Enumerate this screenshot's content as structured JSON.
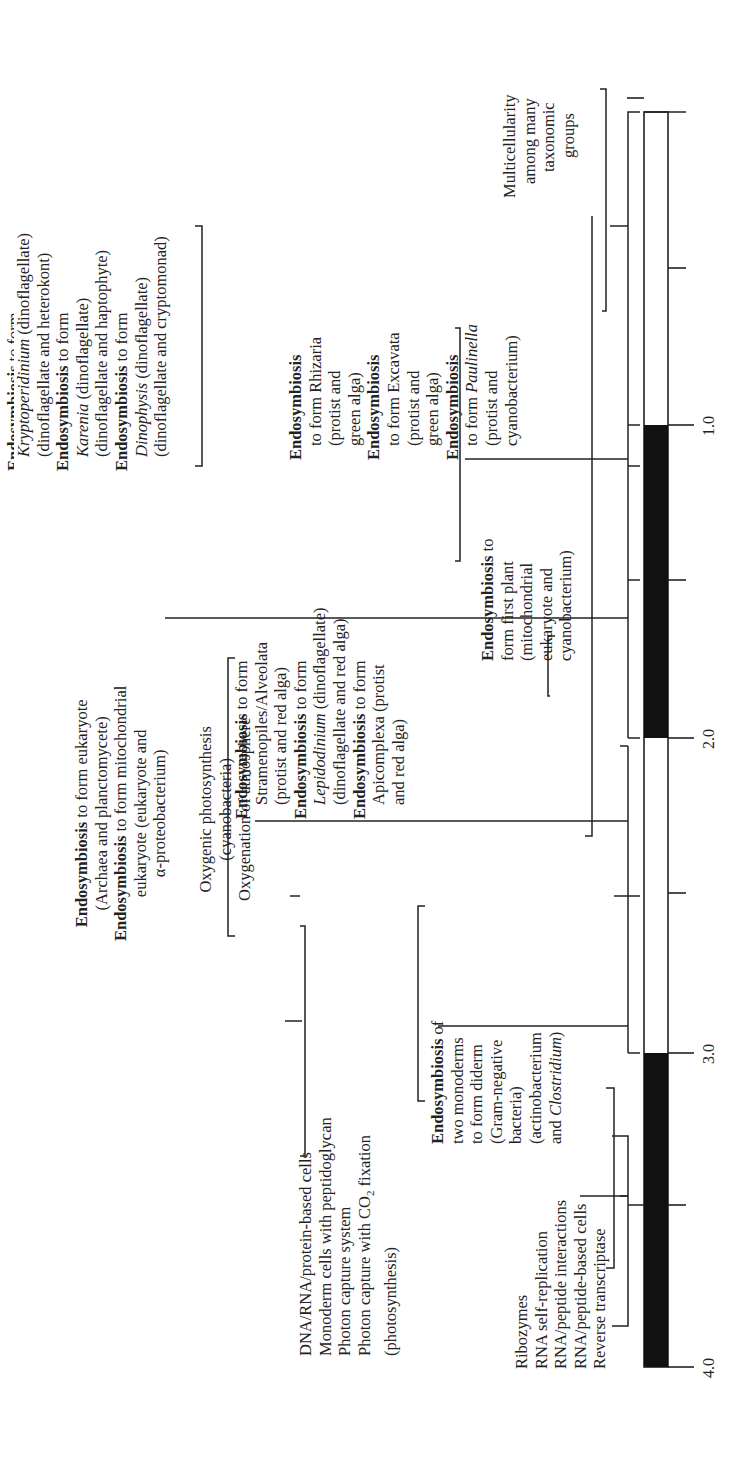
{
  "timeline": {
    "unit_note": "billions of years ago",
    "ticks": [
      "4.0",
      "3.0",
      "2.0",
      "1.0"
    ],
    "dark_segments": [
      [
        "4.0",
        "3.0"
      ],
      [
        "2.0",
        "1.0"
      ]
    ]
  },
  "events": {
    "ribozymes": {
      "lines": [
        "Ribozymes",
        "RNA self-replication",
        "RNA/peptide interactions",
        "RNA/peptide-based cells",
        "Reverse transcriptase"
      ]
    },
    "dna_cells": {
      "lines": [
        "DNA/RNA/protein-based cells",
        "Monoderm cells with peptidoglycan",
        "Photon capture system",
        "Photon capture with CO",
        "(photosynthesis)"
      ],
      "co2_sub": "2",
      "co2_tail": " fixation"
    },
    "diderm": {
      "bold": "Endosymbiosis",
      "lines": [
        " of",
        "two monoderms",
        "to form diderm",
        "(Gram-negative",
        "bacteria)",
        "(actinobacterium",
        "and "
      ],
      "italic": "Clostridium",
      "close": ")"
    },
    "oxygenic": {
      "lines": [
        "Oxygenic photosynthesis",
        "(cyanobacteria)",
        "Oxygenation of atmosphere"
      ]
    },
    "eukaryote": {
      "bold": "Endosymbiosis",
      "line1": " to form eukaryote",
      "line2": "(Archaea and planctomycete)",
      "line3": " to form mitochondrial",
      "line4": "eukaryote (eukaryote and",
      "line5": "α-proteobacterium)"
    },
    "first_plant": {
      "bold": "Endosymbiosis",
      "line1": " to",
      "lines": [
        "form first plant",
        "(mitochondrial",
        "eukaryote and",
        "cyanobacterium)"
      ]
    },
    "stramenopiles": {
      "bold": "Endosymbiosis",
      "to_form": " to form",
      "l1": "Stramenopiles/Alveolata",
      "l2": "(protist and red alga)",
      "l3_italic": "Lepidodinium",
      "l3_tail": " (dinoflagellate)",
      "l4": "(dinoflagellate and red alga)",
      "l5": "Apicomplexa (protist",
      "l6": "and red alga)"
    },
    "dinoflagellates": {
      "bold": "Endosymbiosis",
      "to_form": " to form",
      "k_italic": "Kryptoperidinium",
      "k_tail": " (dinoflagellate)",
      "k2": "(dinoflagellate and heterokont)",
      "ka_italic": "Karenia",
      "ka_tail": " (dinoflagellate)",
      "ka2": "(dinoflagellate and haptophyte)",
      "d_italic": "Dinophysis",
      "d_tail": " (dinoflagellate)",
      "d2": "(dinoflagellate and cryptomonad)"
    },
    "green_alga": {
      "bold": "Endosymbiosis",
      "r1": "to form Rhizaria",
      "r2": "(protist and",
      "r3": "green alga)",
      "e1": "to form Excavata",
      "e2": "(protist and",
      "e3": "green alga)",
      "p1": "to form ",
      "p1_italic": "Paulinella",
      "p2": "(protist and",
      "p3": "cyanobacterium)"
    },
    "multicellularity": {
      "lines": [
        "Multicellularity",
        "among many",
        "taxonomic",
        "groups"
      ]
    }
  }
}
